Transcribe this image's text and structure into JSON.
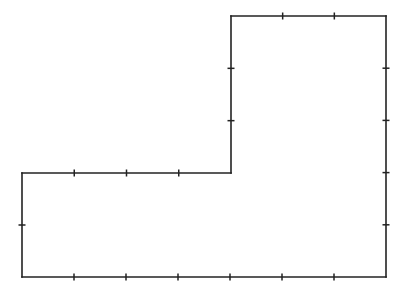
{
  "diagram": {
    "title": "",
    "type": "rectilinear L-shaped polygon with unit tick marks",
    "unit_px": 52,
    "stroke_color": "#222222",
    "background": "#ffffff",
    "vertices": [
      {
        "x": 22,
        "y": 173
      },
      {
        "x": 231,
        "y": 173
      },
      {
        "x": 231,
        "y": 16
      },
      {
        "x": 386,
        "y": 16
      },
      {
        "x": 386,
        "y": 277
      },
      {
        "x": 22,
        "y": 277
      }
    ],
    "edges": [
      {
        "name": "middle-horizontal-edge",
        "units": 4
      },
      {
        "name": "upper-left-vertical-edge",
        "units": 3
      },
      {
        "name": "top-edge",
        "units": 3
      },
      {
        "name": "right-edge",
        "units": 5
      },
      {
        "name": "bottom-edge",
        "units": 7
      },
      {
        "name": "left-edge",
        "units": 2
      }
    ]
  }
}
